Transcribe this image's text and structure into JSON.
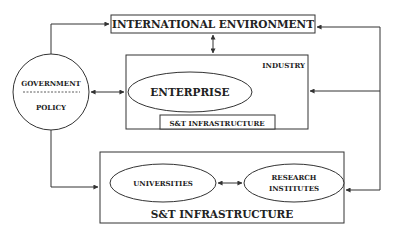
{
  "diagram": {
    "international_environment": "INTERNATIONAL ENVIRONMENT",
    "government": {
      "line1": "GOVERNMENT",
      "line2": "POLICY"
    },
    "industry": {
      "label": "INDUSTRY",
      "enterprise": "ENTERPRISE",
      "inner_infrastructure": "S&T INFRASTRUCTURE"
    },
    "st_infrastructure": {
      "label": "S&T INFRASTRUCTURE",
      "universities": "UNIVERSITIES",
      "research": {
        "line1": "RESEARCH",
        "line2": "INSTITUTES"
      }
    }
  },
  "colors": {
    "stroke": "#333333",
    "text": "#222222",
    "background": "#ffffff"
  }
}
